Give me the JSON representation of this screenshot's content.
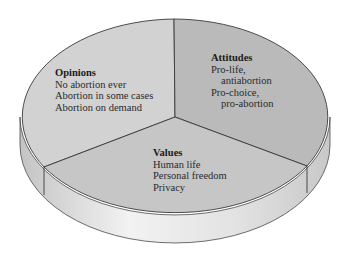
{
  "diagram": {
    "type": "3d-pie",
    "colors": {
      "opinions": "#d2d2d2",
      "attitudes": "#bababa",
      "values": "#c6c6c6",
      "side_light": "#eeeeee",
      "side_dark": "#bdbdbd",
      "outline": "#3a3a3a"
    },
    "slices": [
      {
        "title": "Opinions",
        "items": [
          "No abortion ever",
          "Abortion in some cases",
          "Abortion on demand"
        ]
      },
      {
        "title": "Attitudes",
        "items": [
          "Pro-life,",
          "antiabortion",
          "Pro-choice,",
          "pro-abortion"
        ]
      },
      {
        "title": "Values",
        "items": [
          "Human life",
          "Personal freedom",
          "Privacy"
        ]
      }
    ]
  }
}
